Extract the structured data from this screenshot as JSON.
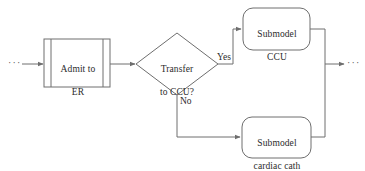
{
  "diagram": {
    "background_color": "#ffffff",
    "stroke_color": "#6e6e6e",
    "text_color": "#2b2b2b",
    "nodes": {
      "entry_ellipsis": {
        "label": "···",
        "shape": "ellipsis"
      },
      "admit_er": {
        "label": "Admit to\nER",
        "shape": "predefined-process",
        "line1": "Admit to",
        "line2": "ER"
      },
      "transfer_decision": {
        "label": "Transfer\nto CCU?",
        "shape": "diamond",
        "line1": "Transfer",
        "line2": "to CCU?"
      },
      "submodel_ccu": {
        "label": "Submodel\nCCU",
        "shape": "rounded-rectangle",
        "line1": "Submodel",
        "line2": "CCU"
      },
      "submodel_cardiac_cath": {
        "label": "Submodel\ncardiac cath",
        "shape": "rounded-rectangle",
        "line1": "Submodel",
        "line2": "cardiac cath"
      },
      "exit_ellipsis": {
        "label": "···",
        "shape": "ellipsis"
      }
    },
    "edges": {
      "entry_to_admit": {
        "label": ""
      },
      "admit_to_decision": {
        "label": ""
      },
      "decision_yes": {
        "label": "Yes"
      },
      "decision_no": {
        "label": "No"
      },
      "ccu_to_merge": {
        "label": ""
      },
      "cardiac_to_merge": {
        "label": ""
      },
      "merge_to_exit": {
        "label": ""
      }
    }
  }
}
